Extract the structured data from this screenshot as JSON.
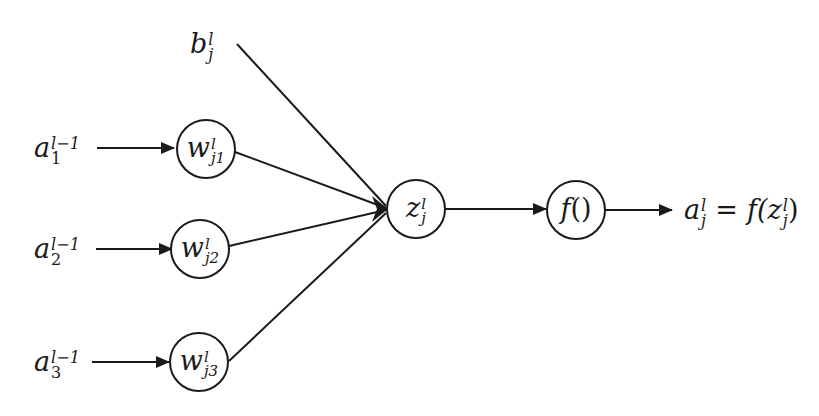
{
  "diagram": {
    "title": "",
    "bias": {
      "base": "b",
      "sup": "l",
      "sub": "j"
    },
    "inputs": [
      {
        "base": "a",
        "sup": "l−1",
        "sub": "1"
      },
      {
        "base": "a",
        "sup": "l−1",
        "sub": "2"
      },
      {
        "base": "a",
        "sup": "l−1",
        "sub": "3"
      }
    ],
    "weights": [
      {
        "base": "w",
        "sup": "l",
        "sub": "j1"
      },
      {
        "base": "w",
        "sup": "l",
        "sub": "j2"
      },
      {
        "base": "w",
        "sup": "l",
        "sub": "j3"
      }
    ],
    "sum_node": {
      "base": "z",
      "sup": "l",
      "sub": "j"
    },
    "activation_node": {
      "base": "f",
      "suffix": "()"
    },
    "output": {
      "lhs_base": "a",
      "lhs_sup": "l",
      "lhs_sub": "j",
      "equals": "=",
      "rhs_func": "f(",
      "rhs_base": "z",
      "rhs_sup": "l",
      "rhs_sub": "j",
      "rhs_close": ")"
    },
    "colors": {
      "stroke": "#1a1a1a",
      "background": "#ffffff"
    }
  }
}
